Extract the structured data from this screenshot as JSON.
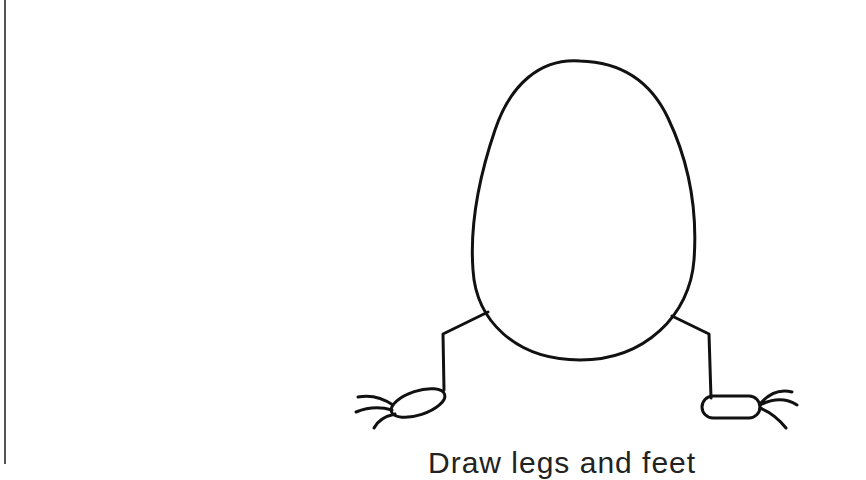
{
  "diagram": {
    "caption": "Draw legs and feet",
    "stroke_color": "#111111",
    "background": "#ffffff",
    "parts": [
      "egg-body",
      "left-leg",
      "right-leg",
      "left-foot",
      "right-foot",
      "left-toes",
      "right-toes"
    ]
  }
}
